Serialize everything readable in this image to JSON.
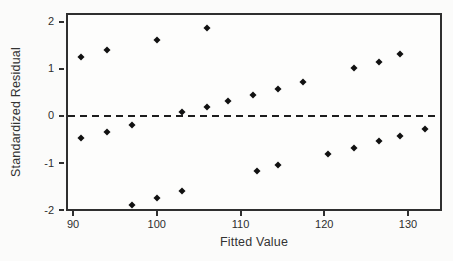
{
  "figure": {
    "background": "#fbfbfa",
    "ink_color": "#2f2f2f",
    "marker_color": "#111111"
  },
  "chart_data": {
    "type": "scatter",
    "title": "",
    "xlabel": "Fitted Value",
    "ylabel": "Standardized Residual",
    "xlim": [
      89.16,
      134.06
    ],
    "ylim": [
      -2.02,
      2.19
    ],
    "x_ticks": [
      90,
      100,
      110,
      120,
      130
    ],
    "y_ticks": [
      2,
      1,
      0,
      -1,
      -2
    ],
    "grid": false,
    "legend": "none",
    "marker": "filled-diamond",
    "reference_line_y": 0,
    "reference_line_style": "dashed",
    "points": [
      [
        91,
        1.25
      ],
      [
        94,
        1.4
      ],
      [
        100,
        1.62
      ],
      [
        106,
        1.87
      ],
      [
        103,
        0.08
      ],
      [
        106,
        0.2
      ],
      [
        108.5,
        0.32
      ],
      [
        111.5,
        0.45
      ],
      [
        114.5,
        0.58
      ],
      [
        117.5,
        0.73
      ],
      [
        123.5,
        1.02
      ],
      [
        126.5,
        1.15
      ],
      [
        129,
        1.32
      ],
      [
        91,
        -0.47
      ],
      [
        94,
        -0.35
      ],
      [
        97,
        -0.2
      ],
      [
        97,
        -1.9
      ],
      [
        100,
        -1.75
      ],
      [
        103,
        -1.6
      ],
      [
        112,
        -1.17
      ],
      [
        114.5,
        -1.04
      ],
      [
        120.5,
        -0.8
      ],
      [
        123.5,
        -0.67
      ],
      [
        126.5,
        -0.53
      ],
      [
        129,
        -0.42
      ],
      [
        132,
        -0.27
      ]
    ]
  }
}
